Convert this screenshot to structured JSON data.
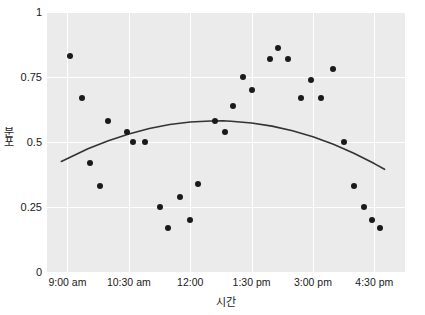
{
  "chart_data": {
    "type": "scatter",
    "title": "",
    "xlabel": "시간",
    "ylabel": "분포",
    "xlim": [
      8.5,
      17.25
    ],
    "ylim": [
      0,
      1
    ],
    "grid": true,
    "legend": null,
    "marker_color": "#1a1a1a",
    "trend_color": "#333333",
    "plot_background": "#ebebeb",
    "gridline_color": "#ffffff",
    "xticks": [
      {
        "value": 9,
        "label": "9:00 am"
      },
      {
        "value": 10.5,
        "label": "10:30 am"
      },
      {
        "value": 12,
        "label": "12:00"
      },
      {
        "value": 13.5,
        "label": "1:30 pm"
      },
      {
        "value": 15,
        "label": "3:00 pm"
      },
      {
        "value": 16.5,
        "label": "4:30 pm"
      }
    ],
    "yticks": [
      {
        "value": 0,
        "label": "0"
      },
      {
        "value": 0.25,
        "label": "0.25"
      },
      {
        "value": 0.5,
        "label": "0.5"
      },
      {
        "value": 0.75,
        "label": "0.75"
      },
      {
        "value": 1,
        "label": "1"
      }
    ],
    "points": [
      {
        "x": 9.05,
        "y": 0.83
      },
      {
        "x": 9.35,
        "y": 0.67
      },
      {
        "x": 9.55,
        "y": 0.42
      },
      {
        "x": 9.8,
        "y": 0.33
      },
      {
        "x": 10.0,
        "y": 0.58
      },
      {
        "x": 10.45,
        "y": 0.54
      },
      {
        "x": 10.6,
        "y": 0.5
      },
      {
        "x": 10.9,
        "y": 0.5
      },
      {
        "x": 11.25,
        "y": 0.25
      },
      {
        "x": 11.45,
        "y": 0.17
      },
      {
        "x": 11.75,
        "y": 0.29
      },
      {
        "x": 12.0,
        "y": 0.2
      },
      {
        "x": 12.2,
        "y": 0.34
      },
      {
        "x": 12.6,
        "y": 0.58
      },
      {
        "x": 12.85,
        "y": 0.54
      },
      {
        "x": 13.05,
        "y": 0.64
      },
      {
        "x": 13.3,
        "y": 0.75
      },
      {
        "x": 13.5,
        "y": 0.7
      },
      {
        "x": 13.95,
        "y": 0.82
      },
      {
        "x": 14.15,
        "y": 0.86
      },
      {
        "x": 14.4,
        "y": 0.82
      },
      {
        "x": 14.7,
        "y": 0.67
      },
      {
        "x": 14.95,
        "y": 0.74
      },
      {
        "x": 15.2,
        "y": 0.67
      },
      {
        "x": 15.5,
        "y": 0.78
      },
      {
        "x": 15.75,
        "y": 0.5
      },
      {
        "x": 16.0,
        "y": 0.33
      },
      {
        "x": 16.25,
        "y": 0.25
      },
      {
        "x": 16.45,
        "y": 0.2
      },
      {
        "x": 16.65,
        "y": 0.17
      }
    ],
    "trend": {
      "type": "quadratic-fit",
      "points": [
        {
          "x": 8.85,
          "y": 0.425
        },
        {
          "x": 9.5,
          "y": 0.474
        },
        {
          "x": 10.0,
          "y": 0.505
        },
        {
          "x": 10.5,
          "y": 0.531
        },
        {
          "x": 11.0,
          "y": 0.552
        },
        {
          "x": 11.5,
          "y": 0.567
        },
        {
          "x": 12.0,
          "y": 0.577
        },
        {
          "x": 12.5,
          "y": 0.581
        },
        {
          "x": 12.8,
          "y": 0.582
        },
        {
          "x": 13.0,
          "y": 0.58
        },
        {
          "x": 13.5,
          "y": 0.573
        },
        {
          "x": 14.0,
          "y": 0.561
        },
        {
          "x": 14.5,
          "y": 0.543
        },
        {
          "x": 15.0,
          "y": 0.52
        },
        {
          "x": 15.5,
          "y": 0.491
        },
        {
          "x": 16.0,
          "y": 0.457
        },
        {
          "x": 16.5,
          "y": 0.417
        },
        {
          "x": 16.75,
          "y": 0.395
        }
      ]
    }
  }
}
